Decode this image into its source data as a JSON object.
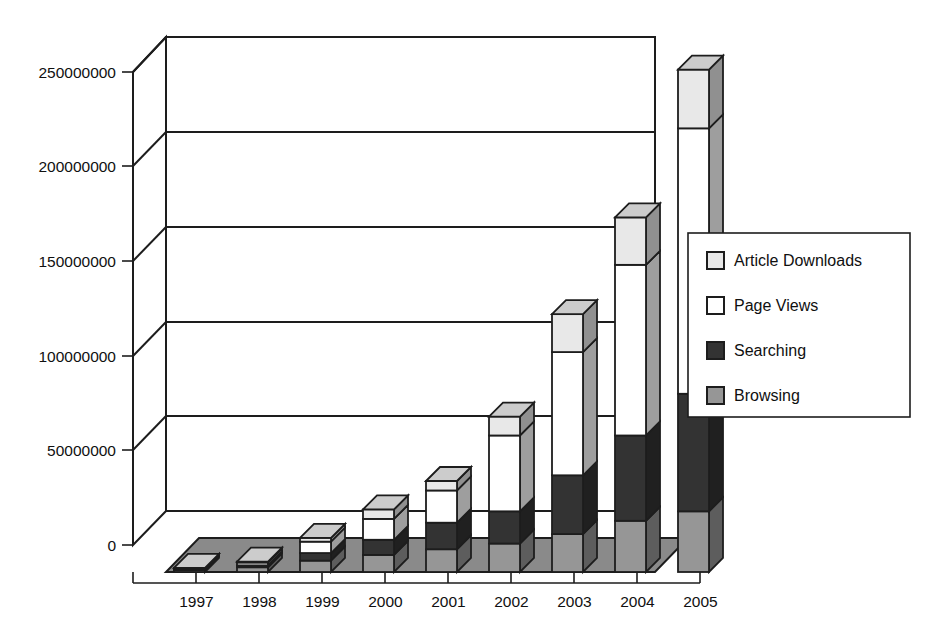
{
  "chart_data": {
    "type": "bar",
    "subtype": "stacked-3d-column",
    "title": "",
    "xlabel": "",
    "ylabel": "",
    "categories": [
      "1997",
      "1998",
      "1999",
      "2000",
      "2001",
      "2002",
      "2003",
      "2004",
      "2005"
    ],
    "series": [
      {
        "name": "Browsing",
        "color": "#969696",
        "values": [
          1000000,
          2500000,
          6000000,
          9000000,
          12000000,
          15000000,
          20000000,
          27000000,
          32000000
        ]
      },
      {
        "name": "Searching",
        "color": "#333333",
        "values": [
          500000,
          1000000,
          4000000,
          8000000,
          14000000,
          17000000,
          31000000,
          45000000,
          62000000
        ]
      },
      {
        "name": "Page Views",
        "color": "#ffffff",
        "values": [
          500000,
          1500000,
          6000000,
          11000000,
          17000000,
          40000000,
          65000000,
          90000000,
          140000000
        ]
      },
      {
        "name": "Article Downloads",
        "color": "#e8e8e8",
        "values": [
          200000,
          500000,
          2000000,
          5000000,
          5000000,
          10000000,
          20000000,
          25000000,
          31000000
        ]
      }
    ],
    "totals": [
      2200000,
      5500000,
      18000000,
      33000000,
      48000000,
      82000000,
      136000000,
      187000000,
      265000000
    ],
    "ylim": [
      0,
      250000000
    ],
    "ytick_step": 50000000,
    "ytick_labels": [
      "0",
      "50000000",
      "100000000",
      "150000000",
      "200000000",
      "250000000"
    ],
    "ytick_values": [
      0,
      50000000,
      100000000,
      150000000,
      200000000,
      250000000
    ],
    "grid": true,
    "grid_axis": "y",
    "legend_position": "right",
    "legend_entries": [
      "Article Downloads",
      "Page Views",
      "Searching",
      "Browsing"
    ]
  },
  "legend": {
    "items": [
      {
        "label": "Article Downloads",
        "swatch": "#e8e8e8"
      },
      {
        "label": "Page Views",
        "swatch": "#ffffff"
      },
      {
        "label": "Searching",
        "swatch": "#333333"
      },
      {
        "label": "Browsing",
        "swatch": "#969696"
      }
    ]
  },
  "axis": {
    "y_labels": [
      "250000000",
      "200000000",
      "150000000",
      "100000000",
      "50000000",
      "0"
    ],
    "x_labels": [
      "1997",
      "1998",
      "1999",
      "2000",
      "2001",
      "2002",
      "2003",
      "2004",
      "2005"
    ]
  },
  "colors": {
    "browsing": "#969696",
    "searching": "#333333",
    "page_views": "#ffffff",
    "article_downloads": "#e8e8e8",
    "floor": "#8a8a8a",
    "outline": "#1d1d1d",
    "background": "#ffffff"
  }
}
